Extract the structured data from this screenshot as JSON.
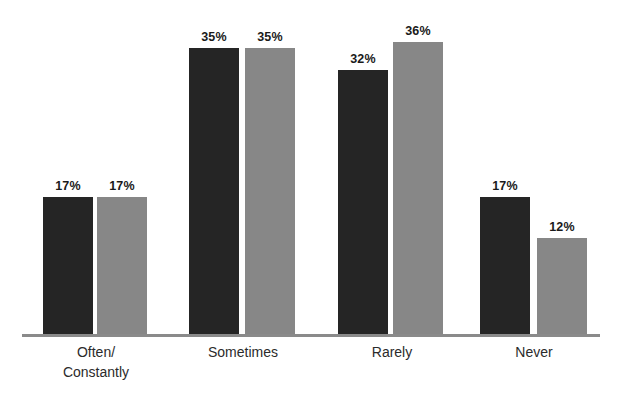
{
  "chart_data": {
    "type": "bar",
    "title": "",
    "subtitle": "",
    "xlabel": "",
    "ylabel": "",
    "ylim": [
      0,
      40
    ],
    "grid": false,
    "legend": "none",
    "axis_line_color": "#8a8a8a",
    "background": "#ffffff",
    "categories": [
      "Often/\nConstantly",
      "Sometimes",
      "Rarely",
      "Never"
    ],
    "category_lines": [
      [
        "Often/",
        "Constantly"
      ],
      [
        "Sometimes"
      ],
      [
        "Rarely"
      ],
      [
        "Never"
      ]
    ],
    "series": [
      {
        "name": "series-a",
        "color": "#252525",
        "values": [
          17,
          35,
          32,
          17
        ],
        "labels": [
          "17%",
          "35%",
          "32%",
          "17%"
        ]
      },
      {
        "name": "series-b",
        "color": "#878787",
        "values": [
          17,
          35,
          36,
          12
        ],
        "labels": [
          "17%",
          "35%",
          "36%",
          "12%"
        ]
      }
    ],
    "value_label_suffix": "%"
  },
  "bars": [
    {
      "id": "often-a",
      "label": "17%",
      "left": 43,
      "width": 50,
      "height": 138,
      "series": "a"
    },
    {
      "id": "often-b",
      "label": "17%",
      "left": 97,
      "width": 50,
      "height": 138,
      "series": "b"
    },
    {
      "id": "sometimes-a",
      "label": "35%",
      "left": 189,
      "width": 50,
      "height": 287,
      "series": "a"
    },
    {
      "id": "sometimes-b",
      "label": "35%",
      "left": 245,
      "width": 50,
      "height": 287,
      "series": "b"
    },
    {
      "id": "rarely-a",
      "label": "32%",
      "left": 338,
      "width": 50,
      "height": 265,
      "series": "a"
    },
    {
      "id": "rarely-b",
      "label": "36%",
      "left": 393,
      "width": 50,
      "height": 293,
      "series": "b"
    },
    {
      "id": "never-a",
      "label": "17%",
      "left": 480,
      "width": 50,
      "height": 138,
      "series": "a"
    },
    {
      "id": "never-b",
      "label": "12%",
      "left": 537,
      "width": 50,
      "height": 97,
      "series": "b"
    }
  ],
  "category_positions": [
    {
      "id": "often",
      "center": 96,
      "top": 342
    },
    {
      "id": "sometimes",
      "center": 243,
      "top": 342
    },
    {
      "id": "rarely",
      "center": 392,
      "top": 342
    },
    {
      "id": "never",
      "center": 534,
      "top": 342
    }
  ]
}
